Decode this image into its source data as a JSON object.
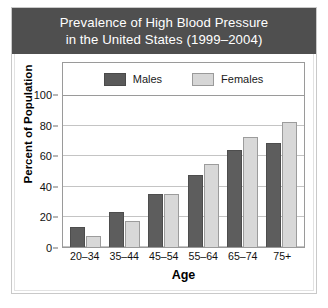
{
  "chart_data": {
    "type": "bar",
    "title": "Prevalence of High Blood Pressure\nin the United States (1999–2004)",
    "xlabel": "Age",
    "ylabel": "Percent of Population",
    "categories": [
      "20–34",
      "35–44",
      "45–54",
      "55–64",
      "65–74",
      "75+"
    ],
    "series": [
      {
        "name": "Males",
        "color": "#5d5d5d",
        "values": [
          13,
          23,
          35,
          48,
          64,
          69
        ]
      },
      {
        "name": "Females",
        "color": "#d8d8d8",
        "values": [
          7,
          17,
          35,
          55,
          73,
          83
        ]
      }
    ],
    "ylim": [
      0,
      100
    ],
    "yticks": [
      0,
      20,
      40,
      60,
      80,
      100
    ],
    "ytick_labels": [
      "0",
      "20",
      "40",
      "60",
      "80",
      "100"
    ],
    "grid": true,
    "legend_position": "top-inside"
  },
  "style": {
    "title_bg": "#4f4f4f",
    "title_fg": "#ffffff",
    "male_color": "#5d5d5d",
    "female_color": "#d8d8d8",
    "grid_color": "#c4c4c4",
    "frame_color": "#9a9a9a"
  }
}
